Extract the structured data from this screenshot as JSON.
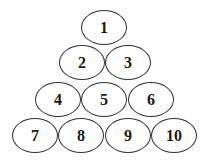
{
  "diagram": {
    "type": "number-pyramid",
    "rows": [
      {
        "cells": [
          {
            "label": "1",
            "x": 81,
            "y": 10
          }
        ]
      },
      {
        "cells": [
          {
            "label": "2",
            "x": 59,
            "y": 45
          },
          {
            "label": "3",
            "x": 105,
            "y": 45
          }
        ]
      },
      {
        "cells": [
          {
            "label": "4",
            "x": 35,
            "y": 82
          },
          {
            "label": "5",
            "x": 81,
            "y": 82
          },
          {
            "label": "6",
            "x": 128,
            "y": 82
          }
        ]
      },
      {
        "cells": [
          {
            "label": "7",
            "x": 12,
            "y": 118
          },
          {
            "label": "8",
            "x": 58,
            "y": 118
          },
          {
            "label": "9",
            "x": 105,
            "y": 118
          },
          {
            "label": "10",
            "x": 151,
            "y": 118
          }
        ]
      }
    ]
  }
}
